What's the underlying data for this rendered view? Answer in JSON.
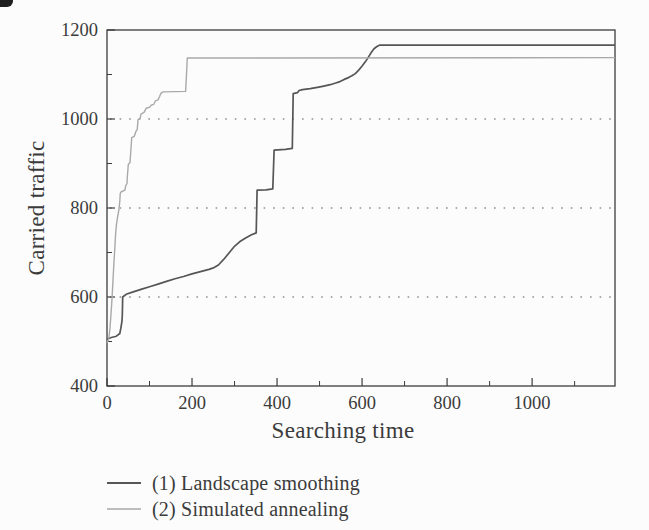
{
  "figure": {
    "background": "#fcfcfc",
    "frame_color": "#3c3c3c",
    "text_color": "#3b3b3b",
    "grid_color": "#909090",
    "artifact": "scan-corner-mark"
  },
  "chart_data": {
    "type": "line",
    "title": "",
    "xlabel": "Searching time",
    "ylabel": "Carried traffic",
    "xlim": [
      0,
      1195
    ],
    "ylim": [
      400,
      1200
    ],
    "x_major_ticks": [
      0,
      200,
      400,
      600,
      800,
      1000
    ],
    "x_minor_ticks": [
      100,
      300,
      500,
      700,
      900,
      1100
    ],
    "y_major_ticks": [
      400,
      600,
      800,
      1000,
      1200
    ],
    "y_minor_ticks": [
      500,
      700,
      900,
      1100
    ],
    "gridlines_y": [
      600,
      800,
      1000
    ],
    "grid_style": "dotted",
    "legend_position": "below-left",
    "series": [
      {
        "name": "(1) Landscape smoothing",
        "color": "#565656",
        "width": 1.7,
        "points": [
          [
            0,
            505
          ],
          [
            10,
            509
          ],
          [
            22,
            512
          ],
          [
            30,
            518
          ],
          [
            33,
            532
          ],
          [
            35,
            545
          ],
          [
            36,
            558
          ],
          [
            37,
            600
          ],
          [
            45,
            606
          ],
          [
            60,
            611
          ],
          [
            80,
            617
          ],
          [
            100,
            623
          ],
          [
            120,
            629
          ],
          [
            140,
            635
          ],
          [
            160,
            641
          ],
          [
            180,
            646
          ],
          [
            200,
            652
          ],
          [
            220,
            657
          ],
          [
            240,
            662
          ],
          [
            252,
            666
          ],
          [
            262,
            672
          ],
          [
            275,
            685
          ],
          [
            288,
            700
          ],
          [
            300,
            714
          ],
          [
            312,
            724
          ],
          [
            325,
            732
          ],
          [
            340,
            740
          ],
          [
            351,
            744
          ],
          [
            353,
            840
          ],
          [
            374,
            841
          ],
          [
            390,
            843
          ],
          [
            393,
            930
          ],
          [
            420,
            932
          ],
          [
            436,
            934
          ],
          [
            438,
            1057
          ],
          [
            448,
            1059
          ],
          [
            452,
            1064
          ],
          [
            460,
            1066
          ],
          [
            478,
            1068
          ],
          [
            495,
            1071
          ],
          [
            510,
            1074
          ],
          [
            525,
            1077
          ],
          [
            538,
            1081
          ],
          [
            548,
            1084
          ],
          [
            558,
            1089
          ],
          [
            568,
            1093
          ],
          [
            576,
            1097
          ],
          [
            584,
            1102
          ],
          [
            592,
            1110
          ],
          [
            600,
            1119
          ],
          [
            608,
            1129
          ],
          [
            615,
            1139
          ],
          [
            622,
            1150
          ],
          [
            628,
            1158
          ],
          [
            635,
            1163
          ],
          [
            642,
            1166
          ],
          [
            1195,
            1166
          ]
        ]
      },
      {
        "name": "(2) Simulated annealing",
        "color": "#a9a9a9",
        "width": 1.4,
        "points": [
          [
            0,
            497
          ],
          [
            4,
            505
          ],
          [
            7,
            530
          ],
          [
            9,
            556
          ],
          [
            11,
            585
          ],
          [
            12,
            600
          ],
          [
            14,
            638
          ],
          [
            16,
            672
          ],
          [
            18,
            705
          ],
          [
            20,
            738
          ],
          [
            22,
            762
          ],
          [
            25,
            780
          ],
          [
            28,
            796
          ],
          [
            30,
            815
          ],
          [
            31,
            832
          ],
          [
            33,
            836
          ],
          [
            42,
            840
          ],
          [
            44,
            850
          ],
          [
            47,
            855
          ],
          [
            48,
            872
          ],
          [
            50,
            898
          ],
          [
            54,
            902
          ],
          [
            56,
            928
          ],
          [
            57,
            940
          ],
          [
            58,
            958
          ],
          [
            64,
            961
          ],
          [
            68,
            972
          ],
          [
            71,
            976
          ],
          [
            73,
            998
          ],
          [
            78,
            1002
          ],
          [
            80,
            1011
          ],
          [
            84,
            1013
          ],
          [
            88,
            1016
          ],
          [
            92,
            1024
          ],
          [
            100,
            1026
          ],
          [
            104,
            1031
          ],
          [
            110,
            1033
          ],
          [
            114,
            1041
          ],
          [
            120,
            1043
          ],
          [
            124,
            1051
          ],
          [
            127,
            1058
          ],
          [
            132,
            1061
          ],
          [
            185,
            1062
          ],
          [
            187,
            1100
          ],
          [
            189,
            1137
          ],
          [
            1195,
            1138
          ]
        ]
      }
    ]
  }
}
